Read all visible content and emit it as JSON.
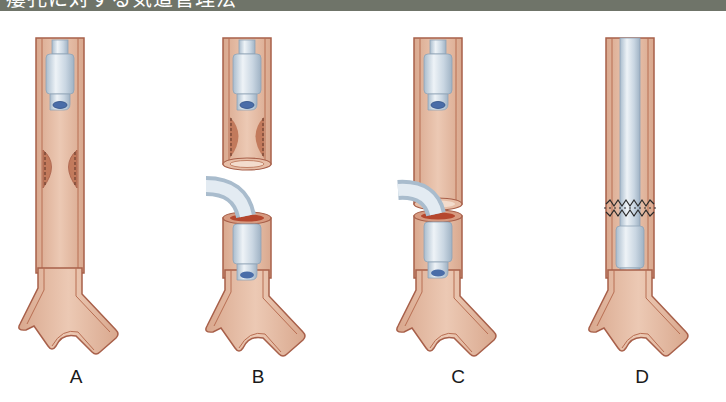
{
  "header": {
    "title": "瘻孔に対する気道管理法"
  },
  "colors": {
    "header_bg": "#6f7469",
    "airway_fill": "#e2bba4",
    "airway_wall": "#c9866a",
    "airway_outline": "#a8604a",
    "stenosis": "#c27a5c",
    "tube_fill": "#c9d6e2",
    "tube_highlight": "#eef3f7",
    "tube_lumen": "#4a6da8",
    "suture": "#2a2a2a"
  },
  "panels": [
    {
      "id": "A",
      "label": "A",
      "description": "Trachea with endotracheal tube above a stenotic segment"
    },
    {
      "id": "B",
      "label": "B",
      "description": "Stenotic segment resected; distal trachea intubated via the surgical field with a curved tube"
    },
    {
      "id": "C",
      "label": "C",
      "description": "Resected ends approximated with field tube still in distal airway"
    },
    {
      "id": "D",
      "label": "D",
      "description": "Anastomosis sutured; oral tube advanced past anastomosis into distal trachea"
    }
  ]
}
